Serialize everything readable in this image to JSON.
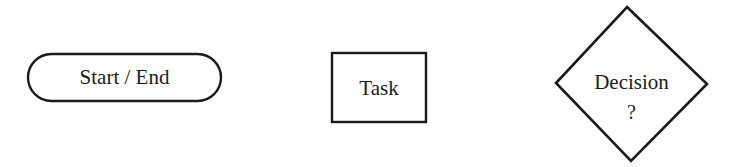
{
  "diagram": {
    "type": "flowchart-legend",
    "shapes": [
      {
        "id": "terminator",
        "shape": "rounded-rectangle",
        "label": "Start / End"
      },
      {
        "id": "process",
        "shape": "rectangle",
        "label": "Task"
      },
      {
        "id": "decision",
        "shape": "diamond",
        "label": "Decision",
        "sublabel": "?"
      }
    ],
    "colors": {
      "stroke": "#1a1a1a",
      "fill": "#ffffff",
      "background": "#ffffff"
    }
  }
}
